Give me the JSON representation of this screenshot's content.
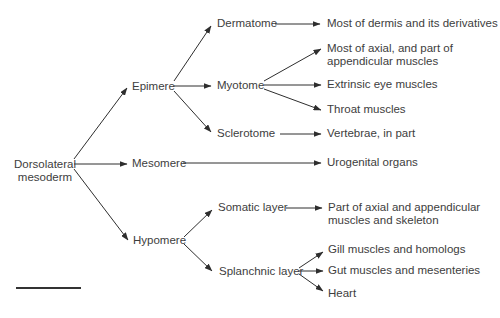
{
  "diagram": {
    "type": "tree",
    "root": {
      "label_line1": "Dorsolateral",
      "label_line2": "mesoderm"
    },
    "level1": [
      {
        "id": "epimere",
        "label": "Epimere"
      },
      {
        "id": "mesomere",
        "label": "Mesomere"
      },
      {
        "id": "hypomere",
        "label": "Hypomere"
      }
    ],
    "level2": [
      {
        "id": "dermatome",
        "label": "Dermatome",
        "parent": "epimere"
      },
      {
        "id": "myotome",
        "label": "Myotome",
        "parent": "epimere"
      },
      {
        "id": "sclerotome",
        "label": "Sclerotome",
        "parent": "epimere"
      },
      {
        "id": "somatic",
        "label": "Somatic layer",
        "parent": "hypomere"
      },
      {
        "id": "splanchnic",
        "label": "Splanchnic layer",
        "parent": "hypomere"
      }
    ],
    "derivatives": [
      {
        "id": "dermis",
        "label": "Most of dermis and its derivatives",
        "parent": "dermatome"
      },
      {
        "id": "axial",
        "label_line1": "Most of axial, and part of",
        "label_line2": "appendicular muscles",
        "parent": "myotome"
      },
      {
        "id": "eye",
        "label": "Extrinsic eye muscles",
        "parent": "myotome"
      },
      {
        "id": "throat",
        "label": "Throat muscles",
        "parent": "myotome"
      },
      {
        "id": "vertebrae",
        "label": "Vertebrae, in part",
        "parent": "sclerotome"
      },
      {
        "id": "urogenital",
        "label": "Urogenital organs",
        "parent": "mesomere"
      },
      {
        "id": "axial-appendicular",
        "label_line1": "Part of axial and appendicular",
        "label_line2": "muscles and skeleton",
        "parent": "somatic"
      },
      {
        "id": "gill",
        "label": "Gill muscles and homologs",
        "parent": "splanchnic"
      },
      {
        "id": "gut",
        "label": "Gut muscles and mesenteries",
        "parent": "splanchnic"
      },
      {
        "id": "heart",
        "label": "Heart",
        "parent": "splanchnic"
      }
    ]
  },
  "colors": {
    "line": "#2e2e2e",
    "text": "#3d3d3d",
    "background": "#ffffff"
  }
}
